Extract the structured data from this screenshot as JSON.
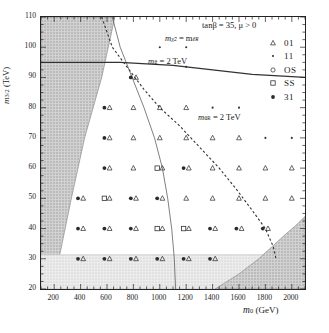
{
  "chart_data": {
    "type": "scatter",
    "title": "",
    "annotation_params": "tanβ = 35,  μ > 0",
    "xlabel": "m",
    "xlabel_sub": "0",
    "xlabel_unit": "(GeV)",
    "ylabel": "m",
    "ylabel_sub": "3/2",
    "ylabel_unit": "(TeV)",
    "xlim": [
      100,
      2100
    ],
    "ylim": [
      20,
      110
    ],
    "xticks": [
      200,
      400,
      600,
      800,
      1000,
      1200,
      1400,
      1600,
      1800,
      2000
    ],
    "xtick_labels": [
      "200",
      "400",
      "600",
      "800",
      "1000",
      "1200",
      "1400",
      "1600",
      "1800",
      "2000"
    ],
    "yticks": [
      20,
      30,
      40,
      50,
      60,
      70,
      80,
      90,
      100,
      110
    ],
    "ytick_labels": [
      "20",
      "30",
      "40",
      "50",
      "60",
      "70",
      "80",
      "90",
      "100",
      "110"
    ],
    "grid": false,
    "legend_position": "upper-right",
    "legend": [
      {
        "marker": "triangle-open",
        "label": "01"
      },
      {
        "marker": "dot",
        "label": "11"
      },
      {
        "marker": "circle-open",
        "label": "OS"
      },
      {
        "marker": "square-open",
        "label": "SS"
      },
      {
        "marker": "star",
        "label": "31"
      }
    ],
    "curves": [
      {
        "name": "m_chi2 = m_eR",
        "style": "solid-thin",
        "label_main": "m",
        "label_sub1": "χ̃",
        "label_sub2": "2",
        "label_eq": " = m",
        "label_sub3": "ẽ",
        "label_sub4": "R",
        "points": [
          [
            640,
            110
          ],
          [
            700,
            100
          ],
          [
            790,
            90
          ],
          [
            880,
            80
          ],
          [
            960,
            70
          ],
          [
            1020,
            60
          ],
          [
            1060,
            50
          ],
          [
            1090,
            40
          ],
          [
            1110,
            30
          ],
          [
            1120,
            20
          ]
        ]
      },
      {
        "name": "m_gluino = 2 TeV",
        "style": "solid-thick",
        "label": "m",
        "label_sub": "g̃",
        "label_eq": " = 2 TeV",
        "points": [
          [
            100,
            95
          ],
          [
            300,
            95
          ],
          [
            500,
            95
          ],
          [
            700,
            95
          ],
          [
            900,
            94.5
          ],
          [
            1100,
            94
          ],
          [
            1300,
            93
          ],
          [
            1500,
            92
          ],
          [
            1700,
            91
          ],
          [
            1900,
            90.5
          ],
          [
            2100,
            90
          ]
        ]
      },
      {
        "name": "m_uR = 2 TeV",
        "style": "dashed",
        "label": "m",
        "label_sub1": "ũ",
        "label_sub2": "R",
        "label_eq": " = 2 TeV",
        "points": [
          [
            560,
            110
          ],
          [
            640,
            100
          ],
          [
            760,
            93
          ],
          [
            880,
            86
          ],
          [
            1000,
            80
          ],
          [
            1150,
            74
          ],
          [
            1300,
            67
          ],
          [
            1450,
            60
          ],
          [
            1580,
            53
          ],
          [
            1700,
            46
          ],
          [
            1800,
            40
          ],
          [
            1860,
            34
          ],
          [
            1880,
            30
          ]
        ]
      }
    ],
    "excluded_regions": [
      {
        "name": "left-no-ewsb",
        "shading": "dark-hatch",
        "vertices": [
          [
            100,
            110
          ],
          [
            660,
            110
          ],
          [
            560,
            90
          ],
          [
            430,
            70
          ],
          [
            330,
            50
          ],
          [
            250,
            33
          ],
          [
            180,
            20
          ],
          [
            100,
            20
          ]
        ]
      },
      {
        "name": "bottom-stau-lsp",
        "shading": "light-hatch",
        "vertices": [
          [
            100,
            31.3
          ],
          [
            2100,
            31.3
          ],
          [
            2100,
            20
          ],
          [
            100,
            20
          ]
        ]
      },
      {
        "name": "bottom-right-dark",
        "shading": "dark-hatch",
        "vertices": [
          [
            1420,
            20
          ],
          [
            1600,
            25
          ],
          [
            1750,
            30
          ],
          [
            1850,
            34
          ],
          [
            1950,
            38
          ],
          [
            2030,
            41
          ],
          [
            2100,
            44
          ],
          [
            2100,
            20
          ]
        ]
      }
    ],
    "points": [
      {
        "x": 1000,
        "y": 100,
        "markers": [
          "dot"
        ]
      },
      {
        "x": 1200,
        "y": 100,
        "markers": [
          "dot"
        ]
      },
      {
        "x": 800,
        "y": 90,
        "markers": [
          "star",
          "triangle"
        ]
      },
      {
        "x": 1200,
        "y": 93.5,
        "markers": [
          "dot"
        ]
      },
      {
        "x": 600,
        "y": 80,
        "markers": [
          "star",
          "triangle"
        ]
      },
      {
        "x": 800,
        "y": 80,
        "markers": [
          "triangle"
        ]
      },
      {
        "x": 1000,
        "y": 80,
        "markers": [
          "triangle"
        ]
      },
      {
        "x": 1200,
        "y": 80,
        "markers": [
          "triangle"
        ]
      },
      {
        "x": 1400,
        "y": 80,
        "markers": [
          "dot"
        ]
      },
      {
        "x": 1600,
        "y": 80,
        "markers": [
          "dot"
        ]
      },
      {
        "x": 600,
        "y": 70,
        "markers": [
          "star",
          "triangle"
        ]
      },
      {
        "x": 800,
        "y": 70,
        "markers": [
          "triangle"
        ]
      },
      {
        "x": 1000,
        "y": 70,
        "markers": [
          "triangle"
        ]
      },
      {
        "x": 1200,
        "y": 70,
        "markers": [
          "triangle"
        ]
      },
      {
        "x": 1400,
        "y": 70,
        "markers": [
          "triangle"
        ]
      },
      {
        "x": 1600,
        "y": 70,
        "markers": [
          "triangle"
        ]
      },
      {
        "x": 1800,
        "y": 70,
        "markers": [
          "dot"
        ]
      },
      {
        "x": 2000,
        "y": 70,
        "markers": [
          "dot"
        ]
      },
      {
        "x": 600,
        "y": 60,
        "markers": [
          "star",
          "triangle"
        ]
      },
      {
        "x": 800,
        "y": 60,
        "markers": [
          "triangle"
        ]
      },
      {
        "x": 1000,
        "y": 60,
        "markers": [
          "square",
          "triangle"
        ]
      },
      {
        "x": 1200,
        "y": 60,
        "markers": [
          "star",
          "triangle"
        ]
      },
      {
        "x": 1400,
        "y": 60,
        "markers": [
          "triangle"
        ]
      },
      {
        "x": 1600,
        "y": 60,
        "markers": [
          "triangle"
        ]
      },
      {
        "x": 1800,
        "y": 60,
        "markers": [
          "triangle"
        ]
      },
      {
        "x": 2000,
        "y": 60,
        "markers": [
          "triangle"
        ]
      },
      {
        "x": 400,
        "y": 50,
        "markers": [
          "star",
          "triangle"
        ]
      },
      {
        "x": 600,
        "y": 50,
        "markers": [
          "square",
          "triangle"
        ]
      },
      {
        "x": 800,
        "y": 50,
        "markers": [
          "star",
          "triangle"
        ]
      },
      {
        "x": 1000,
        "y": 50,
        "markers": [
          "star",
          "triangle"
        ]
      },
      {
        "x": 1200,
        "y": 50,
        "markers": [
          "triangle"
        ]
      },
      {
        "x": 1400,
        "y": 50,
        "markers": [
          "triangle"
        ]
      },
      {
        "x": 1600,
        "y": 50,
        "markers": [
          "triangle"
        ]
      },
      {
        "x": 1800,
        "y": 50,
        "markers": [
          "triangle"
        ]
      },
      {
        "x": 2000,
        "y": 50,
        "markers": [
          "triangle"
        ]
      },
      {
        "x": 400,
        "y": 40,
        "markers": [
          "star",
          "triangle"
        ]
      },
      {
        "x": 600,
        "y": 40,
        "markers": [
          "star",
          "triangle"
        ]
      },
      {
        "x": 800,
        "y": 40,
        "markers": [
          "star",
          "triangle"
        ]
      },
      {
        "x": 1000,
        "y": 40,
        "markers": [
          "square",
          "triangle"
        ]
      },
      {
        "x": 1200,
        "y": 40,
        "markers": [
          "square",
          "triangle"
        ]
      },
      {
        "x": 1400,
        "y": 40,
        "markers": [
          "star",
          "triangle"
        ]
      },
      {
        "x": 1600,
        "y": 40,
        "markers": [
          "star",
          "triangle"
        ]
      },
      {
        "x": 1800,
        "y": 40,
        "markers": [
          "star",
          "triangle"
        ]
      },
      {
        "x": 400,
        "y": 30,
        "markers": [
          "star",
          "triangle"
        ]
      },
      {
        "x": 600,
        "y": 30,
        "markers": [
          "star",
          "triangle"
        ]
      },
      {
        "x": 800,
        "y": 30,
        "markers": [
          "star",
          "triangle"
        ]
      },
      {
        "x": 1000,
        "y": 30,
        "markers": [
          "star",
          "triangle"
        ]
      },
      {
        "x": 1200,
        "y": 30,
        "markers": [
          "star",
          "triangle"
        ]
      },
      {
        "x": 1400,
        "y": 30,
        "markers": [
          "star",
          "triangle"
        ]
      }
    ]
  }
}
